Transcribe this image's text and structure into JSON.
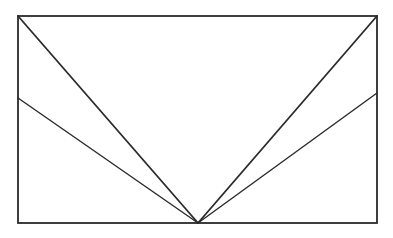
{
  "diagram": {
    "type": "geometric-line-drawing",
    "canvas": {
      "width": 393,
      "height": 238,
      "background": "#ffffff"
    },
    "stroke_color": "#2a2a2a",
    "rectangle": {
      "x1": 18,
      "y1": 16,
      "x2": 377,
      "y2": 223,
      "stroke_width": 1.8
    },
    "apex": {
      "x": 198,
      "y": 223
    },
    "lines": [
      {
        "name": "top-left-diagonal",
        "from": {
          "x": 18,
          "y": 16
        },
        "to": {
          "x": 198,
          "y": 223
        },
        "stroke_width": 1.8
      },
      {
        "name": "left-mid-line",
        "from": {
          "x": 18,
          "y": 98
        },
        "to": {
          "x": 198,
          "y": 223
        },
        "stroke_width": 1.4
      },
      {
        "name": "top-right-diagonal",
        "from": {
          "x": 377,
          "y": 16
        },
        "to": {
          "x": 198,
          "y": 223
        },
        "stroke_width": 1.8
      },
      {
        "name": "right-mid-line",
        "from": {
          "x": 377,
          "y": 93
        },
        "to": {
          "x": 198,
          "y": 223
        },
        "stroke_width": 1.4
      }
    ]
  }
}
